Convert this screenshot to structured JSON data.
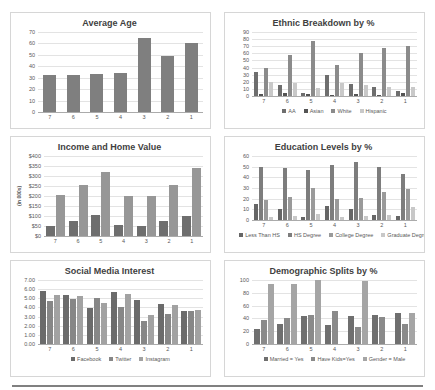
{
  "page": {
    "background_color": "#ffffff",
    "card_border_color": "#d6d6d6",
    "divider_color": "#808080"
  },
  "chart_data": [
    {
      "type": "bar",
      "title": "Average Age",
      "categories": [
        "7",
        "6",
        "5",
        "4",
        "3",
        "2",
        "1"
      ],
      "ylim": [
        0,
        70
      ],
      "ystep": 10,
      "tick_format": "int",
      "ylabel": "",
      "legend": false,
      "grid": true,
      "series": [
        {
          "name": "Average Age",
          "color": "#7f7f7f",
          "values": [
            32,
            32,
            33,
            34,
            65,
            49,
            60
          ]
        }
      ]
    },
    {
      "type": "bar",
      "title": "Ethnic Breakdown by %",
      "categories": [
        "7",
        "6",
        "5",
        "4",
        "3",
        "2",
        "1"
      ],
      "ylim": [
        0,
        90
      ],
      "ystep": 10,
      "tick_format": "int",
      "ylabel": "",
      "legend": "bottom",
      "grid": true,
      "series": [
        {
          "name": "AA",
          "color": "#6e6e6e",
          "values": [
            34,
            15,
            4,
            30,
            17,
            13,
            7
          ]
        },
        {
          "name": "Asian",
          "color": "#545454",
          "values": [
            3,
            4,
            3,
            2,
            3,
            2,
            4
          ]
        },
        {
          "name": "White",
          "color": "#8b8b8b",
          "values": [
            40,
            57,
            77,
            44,
            60,
            67,
            70
          ]
        },
        {
          "name": "Hispanic",
          "color": "#c9c9c9",
          "values": [
            20,
            18,
            11,
            18,
            15,
            13,
            13
          ]
        }
      ]
    },
    {
      "type": "bar",
      "title": "Income and Home Value",
      "categories": [
        "7",
        "6",
        "5",
        "4",
        "3",
        "2",
        "1"
      ],
      "ylim": [
        0,
        400
      ],
      "ystep": 50,
      "tick_format": "usd",
      "ylabel": "(in 000s)",
      "legend": false,
      "grid": true,
      "series": [
        {
          "name": "Income",
          "color": "#6e6e6e",
          "values": [
            50,
            75,
            105,
            55,
            48,
            75,
            100
          ]
        },
        {
          "name": "Home Value",
          "color": "#979797",
          "values": [
            205,
            255,
            320,
            200,
            200,
            255,
            340
          ]
        }
      ]
    },
    {
      "type": "bar",
      "title": "Education Levels by %",
      "categories": [
        "7",
        "6",
        "5",
        "4",
        "3",
        "2",
        "1"
      ],
      "ylim": [
        0,
        60
      ],
      "ystep": 10,
      "tick_format": "int",
      "ylabel": "",
      "legend": "bottom",
      "grid": true,
      "series": [
        {
          "name": "Less Than HS",
          "color": "#666666",
          "values": [
            15,
            10,
            3,
            13,
            10,
            5,
            4
          ]
        },
        {
          "name": "HS Degree",
          "color": "#7d7d7d",
          "values": [
            50,
            49,
            47,
            52,
            54,
            50,
            43
          ]
        },
        {
          "name": "College Degree",
          "color": "#9a9a9a",
          "values": [
            19,
            22,
            30,
            20,
            21,
            26,
            29
          ]
        },
        {
          "name": "Graduate Degree",
          "color": "#c8c8c8",
          "values": [
            3,
            4,
            6,
            3,
            4,
            5,
            12
          ]
        }
      ]
    },
    {
      "type": "bar",
      "title": "Social Media Interest",
      "categories": [
        "7",
        "6",
        "5",
        "4",
        "3",
        "2",
        "1"
      ],
      "ylim": [
        0,
        7
      ],
      "ystep": 1,
      "tick_format": "dec2",
      "ylabel": "",
      "legend": "bottom",
      "grid": true,
      "series": [
        {
          "name": "Facebook",
          "color": "#6b6b6b",
          "values": [
            5.8,
            5.4,
            3.9,
            5.7,
            4.8,
            4.4,
            3.6
          ]
        },
        {
          "name": "Twitter",
          "color": "#878787",
          "values": [
            4.7,
            4.9,
            5.0,
            4.1,
            2.5,
            3.3,
            3.6
          ]
        },
        {
          "name": "Instagram",
          "color": "#a2a2a2",
          "values": [
            5.4,
            5.2,
            4.5,
            5.5,
            3.2,
            4.3,
            3.7
          ]
        }
      ]
    },
    {
      "type": "bar",
      "title": "Demographic Splits by %",
      "categories": [
        "7",
        "6",
        "5",
        "4",
        "3",
        "2",
        "1"
      ],
      "ylim": [
        0,
        100
      ],
      "ystep": 20,
      "tick_format": "int",
      "ylabel": "",
      "legend": "bottom",
      "grid": true,
      "series": [
        {
          "name": "Married = Yes",
          "color": "#6f6f6f",
          "values": [
            23,
            31,
            43,
            29,
            43,
            45,
            48
          ]
        },
        {
          "name": "Have Kids=Yes",
          "color": "#8a8a8a",
          "values": [
            37,
            40,
            45,
            51,
            26,
            42,
            32
          ]
        },
        {
          "name": "Gender = Male",
          "color": "#a5a5a5",
          "values": [
            93,
            93,
            100,
            0,
            99,
            0,
            49
          ]
        }
      ]
    }
  ]
}
